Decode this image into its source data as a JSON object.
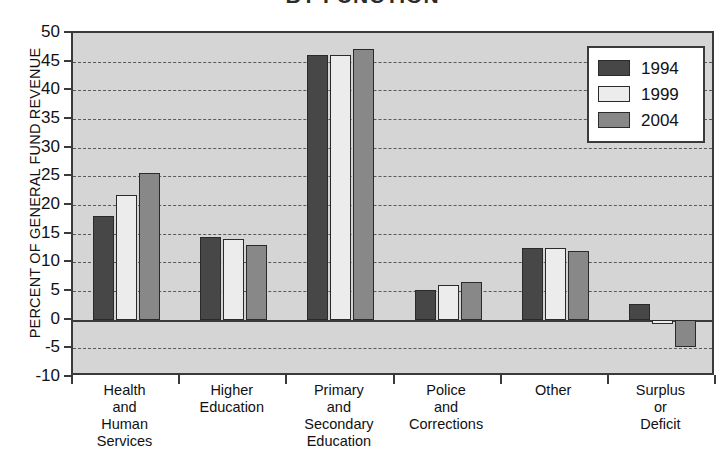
{
  "chart_data": {
    "type": "bar",
    "title": "BY FUNCTION",
    "xlabel": "",
    "ylabel": "PERCENT OF GENERAL FUND REVENUE",
    "ylim": [
      -10,
      50
    ],
    "ytick_step": 5,
    "yticks": [
      "50",
      "45",
      "40",
      "35",
      "30",
      "25",
      "20",
      "15",
      "10",
      "5",
      "0",
      "-5",
      "-10"
    ],
    "grid": true,
    "legend_position": "top-right",
    "categories": [
      "Health\nand\nHuman\nServices",
      "Higher\nEducation",
      "Primary\nand\nSecondary\nEducation",
      "Police\nand\nCorrections",
      "Other",
      "Surplus\nor\nDeficit"
    ],
    "series": [
      {
        "name": "1994",
        "color": "#474747",
        "values": [
          18.0,
          14.5,
          46.2,
          5.2,
          12.5,
          2.7
        ]
      },
      {
        "name": "1999",
        "color": "#ececec",
        "values": [
          21.7,
          14.0,
          46.2,
          6.0,
          12.5,
          -0.8
        ]
      },
      {
        "name": "2004",
        "color": "#888888",
        "values": [
          25.5,
          13.0,
          47.2,
          6.5,
          12.0,
          -4.8
        ]
      }
    ]
  },
  "legend": {
    "items": [
      {
        "label": "1994"
      },
      {
        "label": "1999"
      },
      {
        "label": "2004"
      }
    ]
  }
}
